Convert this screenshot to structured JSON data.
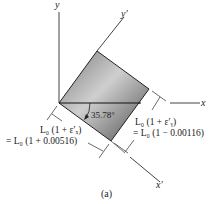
{
  "diagram": {
    "axes": {
      "x_label": "x",
      "y_label": "y",
      "x_prime_label": "x′",
      "y_prime_label": "y′"
    },
    "angle_label": "35.78°",
    "dimension_x": {
      "line1": "L₀ (1 + ε′ₓ)",
      "line2": "= L₀ (1 + 0.00516)"
    },
    "dimension_y": {
      "line1": "L₀ (1 + ε′ᵧ)",
      "line2": "= L₀ (1 − 0.00116)"
    },
    "caption": "(a)",
    "colors": {
      "square_fill_light": "#c8c8c8",
      "square_fill_dark": "#5a5a5a",
      "line": "#333333"
    }
  }
}
